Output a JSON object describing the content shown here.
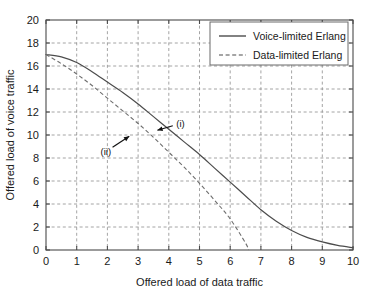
{
  "chart_data": {
    "type": "line",
    "title": "",
    "xlabel": "Offered load of data traffic",
    "ylabel": "Offered load of voice traffic",
    "xlim": [
      0,
      10
    ],
    "ylim": [
      0,
      20
    ],
    "xticks": [
      "0",
      "1",
      "2",
      "3",
      "4",
      "5",
      "6",
      "7",
      "8",
      "9",
      "10"
    ],
    "yticks": [
      "0",
      "2",
      "4",
      "6",
      "8",
      "10",
      "12",
      "14",
      "16",
      "18",
      "20"
    ],
    "grid": true,
    "legend_position": "top-right",
    "series": [
      {
        "name": "Voice-limited Erlang",
        "style": "solid",
        "color": "#4c4c4c",
        "x": [
          0,
          0.5,
          1,
          1.5,
          2,
          2.5,
          3,
          3.5,
          4,
          4.5,
          5,
          5.5,
          6,
          6.5,
          7,
          7.5,
          8,
          8.5,
          9,
          9.5,
          10
        ],
        "values": [
          17.0,
          16.8,
          16.3,
          15.5,
          14.6,
          13.7,
          12.7,
          11.6,
          10.5,
          9.4,
          8.3,
          7.1,
          5.9,
          4.7,
          3.5,
          2.5,
          1.7,
          1.1,
          0.7,
          0.4,
          0.2
        ]
      },
      {
        "name": "Data-limited Erlang",
        "style": "dashed",
        "color": "#6e6e6e",
        "x": [
          0,
          0.5,
          1,
          1.5,
          2,
          2.5,
          3,
          3.5,
          4,
          4.5,
          5,
          5.5,
          6,
          6.5,
          6.6
        ],
        "values": [
          17.0,
          16.2,
          15.3,
          14.3,
          13.2,
          12.1,
          11.0,
          9.8,
          8.5,
          7.2,
          5.8,
          4.3,
          2.7,
          0.6,
          0.0
        ]
      }
    ],
    "annotations": [
      {
        "label": "(i)",
        "label_x": 4.38,
        "label_y": 11.0,
        "target_x": 3.55,
        "target_y": 10.35
      },
      {
        "label": "(ii)",
        "label_x": 1.95,
        "label_y": 8.55,
        "target_x": 2.78,
        "target_y": 10.0
      }
    ]
  }
}
